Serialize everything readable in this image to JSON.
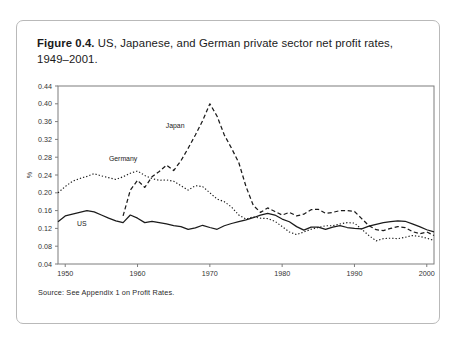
{
  "figure": {
    "label": "Figure 0.4.",
    "caption_line1": "US, Japanese, and German private sector net profit rates,",
    "caption_line2": "1949–2001.",
    "source": "Source: See Appendix 1 on Profit Rates."
  },
  "chart_data": {
    "type": "line",
    "title": "US, Japanese, and German private sector net profit rates, 1949–2001.",
    "xlabel": "",
    "ylabel": "%",
    "xlim": [
      1949,
      2001
    ],
    "ylim": [
      0.04,
      0.44
    ],
    "ytick_step": 0.04,
    "yticks": [
      "0.04",
      "0.08",
      "0.12",
      "0.16",
      "0.20",
      "0.24",
      "0.28",
      "0.32",
      "0.36",
      "0.40",
      "0.44"
    ],
    "xticks": [
      "1950",
      "1960",
      "1970",
      "1980",
      "1990",
      "2000"
    ],
    "xtick_values": [
      1950,
      1960,
      1970,
      1980,
      1990,
      2000
    ],
    "grid": false,
    "legend_position": "inline-annotations",
    "annotations": [
      {
        "text": "US",
        "x": 1952.3,
        "y": 0.125
      },
      {
        "text": "Germany",
        "x": 1958.0,
        "y": 0.272
      },
      {
        "text": "Japan",
        "x": 1965.2,
        "y": 0.345
      }
    ],
    "series": [
      {
        "name": "US",
        "style": "solid",
        "color": "#1b1b1b",
        "x": [
          1949,
          1950,
          1951,
          1952,
          1953,
          1954,
          1955,
          1956,
          1957,
          1958,
          1959,
          1960,
          1961,
          1962,
          1963,
          1964,
          1965,
          1966,
          1967,
          1968,
          1969,
          1970,
          1971,
          1972,
          1973,
          1974,
          1975,
          1976,
          1977,
          1978,
          1979,
          1980,
          1981,
          1982,
          1983,
          1984,
          1985,
          1986,
          1987,
          1988,
          1989,
          1990,
          1991,
          1992,
          1993,
          1994,
          1995,
          1996,
          1997,
          1998,
          1999,
          2000,
          2001
        ],
        "values": [
          0.135,
          0.148,
          0.152,
          0.156,
          0.16,
          0.157,
          0.15,
          0.143,
          0.137,
          0.133,
          0.15,
          0.143,
          0.133,
          0.136,
          0.133,
          0.13,
          0.126,
          0.124,
          0.118,
          0.121,
          0.127,
          0.122,
          0.118,
          0.126,
          0.131,
          0.135,
          0.139,
          0.144,
          0.15,
          0.154,
          0.15,
          0.141,
          0.135,
          0.124,
          0.116,
          0.123,
          0.123,
          0.118,
          0.123,
          0.126,
          0.122,
          0.12,
          0.119,
          0.125,
          0.129,
          0.133,
          0.135,
          0.137,
          0.136,
          0.13,
          0.124,
          0.117,
          0.112
        ]
      },
      {
        "name": "Germany",
        "style": "dotted",
        "color": "#1b1b1b",
        "x": [
          1949,
          1950,
          1951,
          1952,
          1953,
          1954,
          1955,
          1956,
          1957,
          1958,
          1959,
          1960,
          1961,
          1962,
          1963,
          1964,
          1965,
          1966,
          1967,
          1968,
          1969,
          1970,
          1971,
          1972,
          1973,
          1974,
          1975,
          1976,
          1977,
          1978,
          1979,
          1980,
          1981,
          1982,
          1983,
          1984,
          1985,
          1986,
          1987,
          1988,
          1989,
          1990,
          1991,
          1992,
          1993,
          1994,
          1995,
          1996,
          1997,
          1998,
          1999,
          2000,
          2001
        ],
        "values": [
          0.2,
          0.214,
          0.226,
          0.232,
          0.237,
          0.243,
          0.238,
          0.234,
          0.23,
          0.236,
          0.244,
          0.249,
          0.239,
          0.232,
          0.228,
          0.229,
          0.226,
          0.216,
          0.206,
          0.216,
          0.214,
          0.2,
          0.186,
          0.18,
          0.168,
          0.15,
          0.141,
          0.146,
          0.143,
          0.142,
          0.136,
          0.124,
          0.112,
          0.106,
          0.112,
          0.118,
          0.122,
          0.126,
          0.126,
          0.13,
          0.133,
          0.132,
          0.118,
          0.104,
          0.092,
          0.097,
          0.098,
          0.097,
          0.1,
          0.104,
          0.102,
          0.098,
          0.093
        ]
      },
      {
        "name": "Japan",
        "style": "dashed",
        "color": "#1b1b1b",
        "x": [
          1958,
          1959,
          1960,
          1961,
          1962,
          1963,
          1964,
          1965,
          1966,
          1967,
          1968,
          1969,
          1970,
          1971,
          1972,
          1973,
          1974,
          1975,
          1976,
          1977,
          1978,
          1979,
          1980,
          1981,
          1982,
          1983,
          1984,
          1985,
          1986,
          1987,
          1988,
          1989,
          1990,
          1991,
          1992,
          1993,
          1994,
          1995,
          1996,
          1997,
          1998,
          1999,
          2000,
          2001
        ],
        "values": [
          0.148,
          0.206,
          0.228,
          0.212,
          0.236,
          0.248,
          0.262,
          0.25,
          0.272,
          0.3,
          0.33,
          0.362,
          0.4,
          0.372,
          0.33,
          0.3,
          0.268,
          0.214,
          0.172,
          0.156,
          0.166,
          0.158,
          0.15,
          0.156,
          0.148,
          0.152,
          0.162,
          0.163,
          0.154,
          0.156,
          0.16,
          0.16,
          0.158,
          0.142,
          0.126,
          0.117,
          0.115,
          0.12,
          0.124,
          0.122,
          0.113,
          0.108,
          0.112,
          0.104
        ]
      }
    ]
  }
}
